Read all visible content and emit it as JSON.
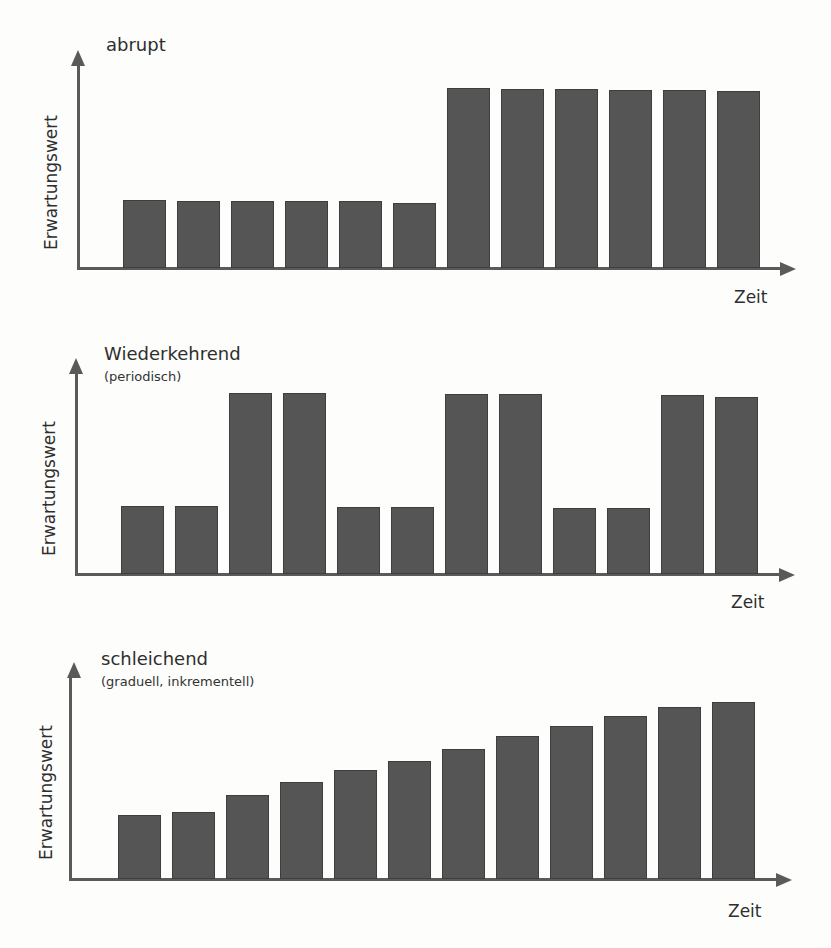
{
  "chart_data": [
    {
      "type": "bar",
      "title": "abrupt",
      "subtitle": "",
      "xlabel": "Zeit",
      "ylabel": "Erwartungswert",
      "categories": [
        "1",
        "2",
        "3",
        "4",
        "5",
        "6",
        "7",
        "8",
        "9",
        "10",
        "11",
        "12"
      ],
      "values": [
        68,
        67,
        67,
        67,
        67,
        65,
        180,
        179,
        179,
        178,
        178,
        177
      ],
      "ylim": [
        0,
        220
      ],
      "grid": false,
      "color": "#555555"
    },
    {
      "type": "bar",
      "title": "Wiederkehrend",
      "subtitle": "(periodisch)",
      "xlabel": "Zeit",
      "ylabel": "Erwartungswert",
      "categories": [
        "1",
        "2",
        "3",
        "4",
        "5",
        "6",
        "7",
        "8",
        "9",
        "10",
        "11",
        "12"
      ],
      "values": [
        68,
        68,
        181,
        181,
        67,
        67,
        180,
        180,
        66,
        66,
        179,
        177
      ],
      "ylim": [
        0,
        220
      ],
      "grid": false,
      "color": "#555555"
    },
    {
      "type": "bar",
      "title": "schleichend",
      "subtitle": "(graduell, inkrementell)",
      "xlabel": "Zeit",
      "ylabel": "Erwartungswert",
      "categories": [
        "1",
        "2",
        "3",
        "4",
        "5",
        "6",
        "7",
        "8",
        "9",
        "10",
        "11",
        "12"
      ],
      "values": [
        64,
        67,
        84,
        97,
        109,
        118,
        130,
        143,
        153,
        163,
        172,
        177
      ],
      "ylim": [
        0,
        215
      ],
      "grid": false,
      "color": "#555555"
    }
  ]
}
